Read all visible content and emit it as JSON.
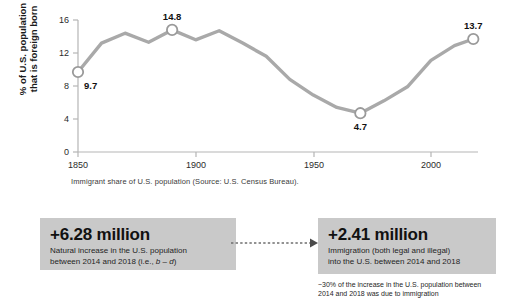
{
  "chart_data": {
    "type": "line",
    "title": "",
    "xlabel": "",
    "ylabel": "% of U.S. population\nthat is foreign born",
    "caption": "Immigrant share of U.S. population (Source: U.S. Census Bureau).",
    "xlim": [
      1850,
      2020
    ],
    "ylim": [
      0,
      16
    ],
    "xticks": [
      1850,
      1900,
      1950,
      2000
    ],
    "yticks": [
      0,
      4,
      8,
      12,
      16
    ],
    "grid": false,
    "legend": "none",
    "series": [
      {
        "name": "Foreign-born share of U.S. population",
        "color": "#a9a9a9",
        "x": [
          1850,
          1860,
          1870,
          1880,
          1890,
          1900,
          1910,
          1920,
          1930,
          1940,
          1950,
          1960,
          1970,
          1980,
          1990,
          2000,
          2010,
          2018
        ],
        "values": [
          9.7,
          13.2,
          14.4,
          13.3,
          14.8,
          13.6,
          14.7,
          13.2,
          11.6,
          8.8,
          6.9,
          5.4,
          4.7,
          6.2,
          7.9,
          11.1,
          12.9,
          13.7
        ]
      }
    ],
    "annotations": [
      {
        "label": "9.7",
        "x": 1850,
        "y": 9.7,
        "marker": true,
        "position": "below-right"
      },
      {
        "label": "14.8",
        "x": 1890,
        "y": 14.8,
        "marker": true,
        "position": "above"
      },
      {
        "label": "4.7",
        "x": 1970,
        "y": 4.7,
        "marker": true,
        "position": "below"
      },
      {
        "label": "13.7",
        "x": 2018,
        "y": 13.7,
        "marker": true,
        "position": "above"
      }
    ]
  },
  "bottom": {
    "natural_increase": {
      "value": "+6.28 million",
      "description_line1": "Natural increase in the U.S. population",
      "description_line2_prefix": "between 2014 and 2018 (i.e., ",
      "description_line2_italic": "b – d",
      "description_line2_suffix": ")"
    },
    "immigration": {
      "value": "+2.41 million",
      "description_line1": "Immigration (both legal and illegal)",
      "description_line2": "into the U.S. between 2014 and 2018",
      "footnote_line1": "~30% of the increase in the U.S. population between",
      "footnote_line2": "2014 and 2018 was due to immigration"
    },
    "connector": {
      "style": "dashed-arrow-right",
      "color": "#6f6f6f"
    }
  },
  "colors": {
    "line": "#a9a9a9",
    "marker_fill": "#ffffff",
    "marker_stroke": "#9a9a9a",
    "box_fill": "#c9c9c9",
    "axis": "#b5b5b5",
    "text": "#1a1a1a"
  }
}
